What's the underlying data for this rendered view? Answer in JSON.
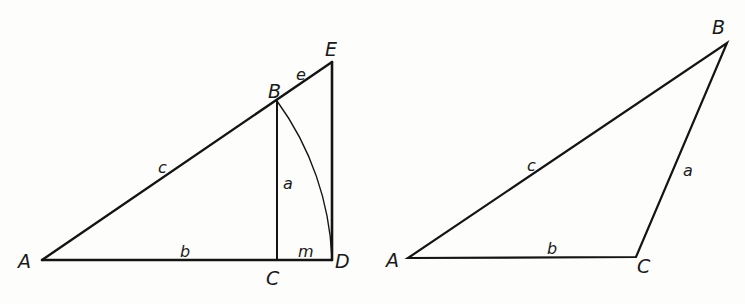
{
  "figures": {
    "left": {
      "points": {
        "A": "A",
        "B": "B",
        "C": "C",
        "D": "D",
        "E": "E"
      },
      "sides": {
        "a": "a",
        "b": "b",
        "c": "c",
        "e": "e",
        "m": "m"
      }
    },
    "right": {
      "points": {
        "A": "A",
        "B": "B",
        "C": "C"
      },
      "sides": {
        "a": "a",
        "b": "b",
        "c": "c"
      }
    }
  },
  "colors": {
    "ink": "#141414",
    "background": "#fdfdfb"
  }
}
